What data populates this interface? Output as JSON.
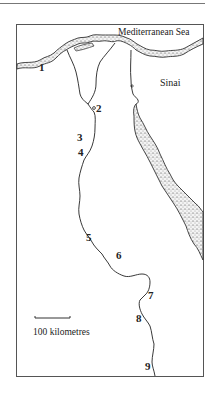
{
  "map": {
    "labels": {
      "sea": "Mediterranean Sea",
      "region": "Sinai"
    },
    "sites": [
      {
        "id": "1",
        "label": "1"
      },
      {
        "id": "2",
        "label": "2"
      },
      {
        "id": "3",
        "label": "3"
      },
      {
        "id": "4",
        "label": "4"
      },
      {
        "id": "5",
        "label": "5"
      },
      {
        "id": "6",
        "label": "6"
      },
      {
        "id": "7",
        "label": "7"
      },
      {
        "id": "8",
        "label": "8"
      },
      {
        "id": "9",
        "label": "9"
      }
    ],
    "scale_bar": {
      "label": "100 kilometres"
    }
  }
}
